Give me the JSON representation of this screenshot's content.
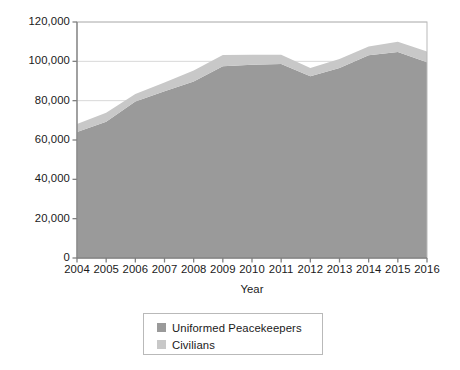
{
  "chart_data": {
    "type": "area",
    "title": "",
    "subtitle": "",
    "xlabel": "Year",
    "ylabel": "Number of Peacekeepers",
    "stacked": true,
    "grid": true,
    "legend_position": "bottom-center",
    "xlim": [
      2004,
      2016
    ],
    "ylim": [
      0,
      120000
    ],
    "ytick_labels": [
      "0",
      "20,000",
      "40,000",
      "60,000",
      "80,000",
      "100,000",
      "120,000"
    ],
    "ytick_values": [
      0,
      20000,
      40000,
      60000,
      80000,
      100000,
      120000
    ],
    "xtick_labels": [
      "2004",
      "2005",
      "2006",
      "2007",
      "2008",
      "2009",
      "2010",
      "2011",
      "2012",
      "2013",
      "2014",
      "2015",
      "2016"
    ],
    "categories": [
      2004,
      2005,
      2006,
      2007,
      2008,
      2009,
      2010,
      2011,
      2012,
      2013,
      2014,
      2015,
      2016
    ],
    "series": [
      {
        "name": "Uniformed Peacekeepers",
        "color": "#9a9a9a",
        "values": [
          64100,
          69300,
          79600,
          84800,
          89800,
          97500,
          98300,
          98600,
          92400,
          96600,
          103100,
          104700,
          99500
        ]
      },
      {
        "name": "Civilians",
        "color": "#c8c8c8",
        "values": [
          4000,
          4600,
          3800,
          4500,
          5600,
          5700,
          5000,
          4800,
          4200,
          4600,
          4400,
          5300,
          5500
        ]
      }
    ],
    "totals": [
      68100,
      73900,
      83400,
      89300,
      95400,
      103200,
      103300,
      103400,
      96600,
      101200,
      107500,
      110000,
      105000
    ],
    "axis_color": "#808080",
    "grid_color": "#d8d8d8"
  },
  "legend": {
    "entries": [
      {
        "label": "Uniformed Peacekeepers"
      },
      {
        "label": "Civilians"
      }
    ]
  }
}
